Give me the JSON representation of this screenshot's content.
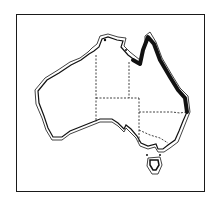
{
  "map": {
    "subject": "Australia",
    "style": "monochrome line map",
    "features": {
      "coastline": "double outline",
      "state_borders": "dashed lines",
      "highlighted_region": "Queensland east coast (thick black line)",
      "island": "Tasmania"
    },
    "colors": {
      "ink": "#111111",
      "background": "#ffffff"
    }
  }
}
